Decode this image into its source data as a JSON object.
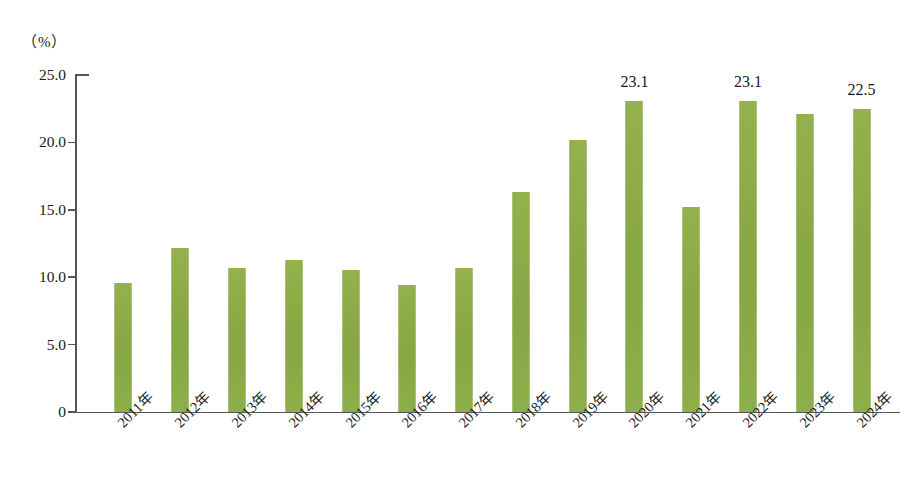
{
  "chart_title": "",
  "unit_label": "（%）",
  "axis": {
    "y_ticks": [
      "0",
      "5.0",
      "10.0",
      "15.0",
      "20.0",
      "25.0"
    ],
    "y_tick_values": [
      0,
      5,
      10,
      15,
      20,
      25
    ],
    "y_min": 0,
    "y_max": 25
  },
  "colors": {
    "bar": "#8FAE49",
    "axis": "#555555",
    "text": "#1a1a1a",
    "background": "#ffffff"
  },
  "chart_data": {
    "type": "bar",
    "title": "",
    "xlabel": "",
    "ylabel": "（%）",
    "ylim": [
      0,
      25
    ],
    "grid": false,
    "legend": false,
    "categories": [
      "2011年",
      "2012年",
      "2013年",
      "2014年",
      "2015年",
      "2016年",
      "2017年",
      "2018年",
      "2019年",
      "2020年",
      "2021年",
      "2022年",
      "2023年",
      "2024年"
    ],
    "values": [
      9.6,
      12.2,
      10.7,
      11.3,
      10.5,
      9.4,
      10.7,
      16.3,
      20.2,
      23.1,
      15.2,
      23.1,
      22.1,
      22.5
    ],
    "value_labels": [
      "",
      "",
      "",
      "",
      "",
      "",
      "",
      "",
      "",
      "23.1",
      "",
      "23.1",
      "",
      "22.5"
    ]
  }
}
